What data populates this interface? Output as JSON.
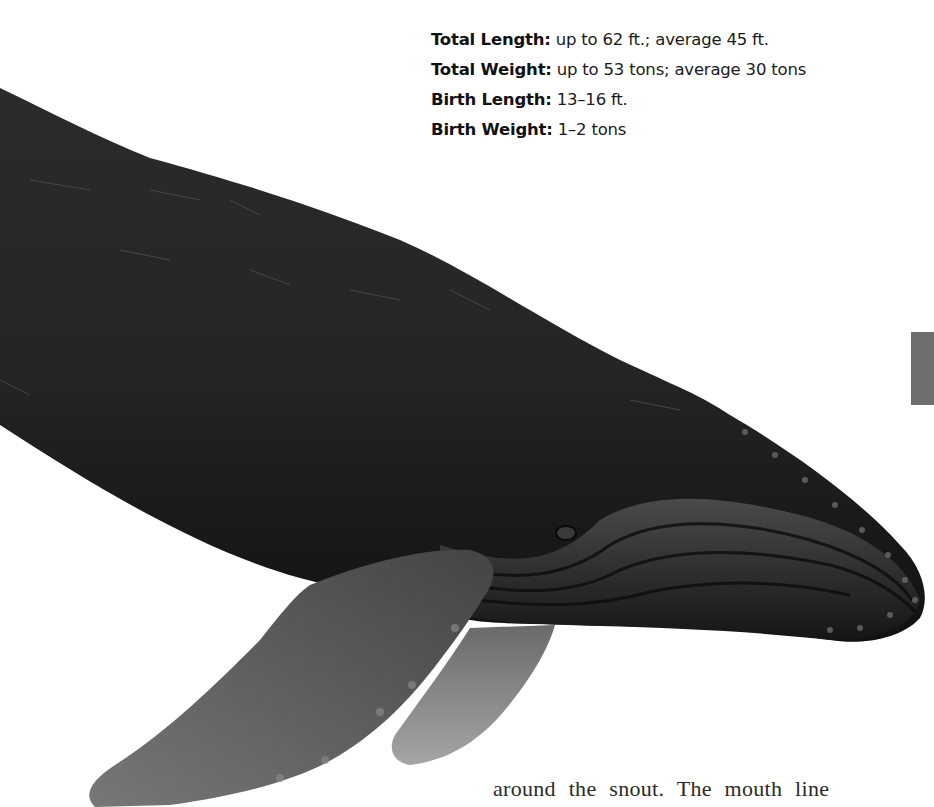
{
  "stats": [
    {
      "label": "Total Length:",
      "value": " up to 62 ft.; average 45 ft."
    },
    {
      "label": "Total Weight:",
      "value": " up to 53 tons; average 30 tons"
    },
    {
      "label": "Birth Length:",
      "value": " 13–16 ft."
    },
    {
      "label": "Birth Weight:",
      "value": " 1–2 tons"
    }
  ],
  "illustration": {
    "subject": "humpback-whale",
    "colors": {
      "body": "#1c1c1c",
      "flipper": "#5a5a5a",
      "flipper_far": "#8a8a8a",
      "tab": "#6f6f6f"
    }
  },
  "body_text": "around the snout. The mouth line"
}
